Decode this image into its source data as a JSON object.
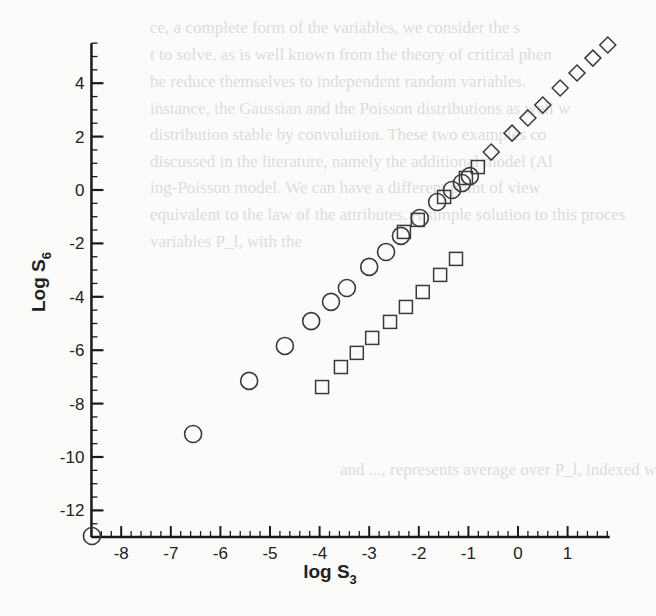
{
  "background_text": [
    {
      "text": "ce, a complete form of the variables, we consider the s",
      "x": 150,
      "y": 18
    },
    {
      "text": "t to solve, as is well known from the theory of critical phen",
      "x": 150,
      "y": 45
    },
    {
      "text": "be reduce themselves to independent random variables.",
      "x": 150,
      "y": 72
    },
    {
      "text": "instance, the Gaussian and the Poisson distributions as well w",
      "x": 150,
      "y": 99
    },
    {
      "text": "distribution stable by convolution.  These two examples co",
      "x": 150,
      "y": 125
    },
    {
      "text": "discussed in the literature, namely the additional model (Al",
      "x": 150,
      "y": 152
    },
    {
      "text": "ing-Poisson model.  We can have a different point of view",
      "x": 150,
      "y": 178
    },
    {
      "text": "equivalent to the law of the attributes. A simple solution to this proces",
      "x": 150,
      "y": 205
    },
    {
      "text": "variables P_l, with the",
      "x": 150,
      "y": 232
    },
    {
      "text": "and ..., represents average over P_l, indexed w",
      "x": 340,
      "y": 460
    }
  ],
  "chart_data": {
    "type": "scatter",
    "title": "",
    "xlabel": "log S3",
    "ylabel": "Log S6",
    "xlim": [
      -8.6,
      1.85
    ],
    "ylim": [
      -13,
      5.5
    ],
    "x_ticks": [
      -8,
      -7,
      -6,
      -5,
      -4,
      -3,
      -2,
      -1,
      0,
      1
    ],
    "y_ticks": [
      -12,
      -10,
      -8,
      -6,
      -4,
      -2,
      0,
      2,
      4
    ],
    "grid": false,
    "legend": null,
    "series": [
      {
        "name": "circles",
        "marker": "circle",
        "points": [
          [
            -8.59,
            -12.96
          ],
          [
            -6.55,
            -9.14
          ],
          [
            -5.42,
            -7.15
          ],
          [
            -4.7,
            -5.84
          ],
          [
            -4.17,
            -4.91
          ],
          [
            -3.77,
            -4.19
          ],
          [
            -3.45,
            -3.67
          ],
          [
            -3.0,
            -2.88
          ],
          [
            -2.66,
            -2.32
          ],
          [
            -2.36,
            -1.72
          ],
          [
            -1.98,
            -1.05
          ],
          [
            -1.63,
            -0.45
          ],
          [
            -1.33,
            0.0
          ],
          [
            -1.13,
            0.26
          ],
          [
            -0.97,
            0.52
          ]
        ]
      },
      {
        "name": "squares",
        "marker": "square",
        "points": [
          [
            -3.95,
            -7.38
          ],
          [
            -3.57,
            -6.63
          ],
          [
            -3.25,
            -6.1
          ],
          [
            -2.94,
            -5.54
          ],
          [
            -2.58,
            -4.94
          ],
          [
            -2.26,
            -4.38
          ],
          [
            -1.92,
            -3.82
          ],
          [
            -1.57,
            -3.18
          ],
          [
            -1.25,
            -2.58
          ],
          [
            -2.3,
            -1.57
          ],
          [
            -2.02,
            -1.12
          ],
          [
            -1.49,
            -0.26
          ],
          [
            -1.05,
            0.45
          ],
          [
            -0.81,
            0.86
          ]
        ]
      },
      {
        "name": "diamonds",
        "marker": "diamond",
        "points": [
          [
            -0.54,
            1.42
          ],
          [
            -0.12,
            2.13
          ],
          [
            0.2,
            2.7
          ],
          [
            0.5,
            3.18
          ],
          [
            0.85,
            3.82
          ],
          [
            1.19,
            4.38
          ],
          [
            1.51,
            4.94
          ],
          [
            1.81,
            5.43
          ]
        ]
      }
    ]
  },
  "colors": {
    "axis": "#1a1a1a",
    "marker": "#3a3a3a",
    "background": "#fbfbfa",
    "bleed_text": "#dcdcdc"
  }
}
